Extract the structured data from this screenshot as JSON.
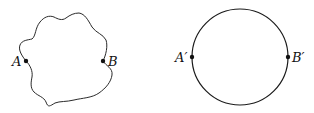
{
  "figure": {
    "left_shape": {
      "type": "irregular-closed-curve",
      "points": {
        "A": {
          "label": "A",
          "x": 26,
          "y": 61
        },
        "B": {
          "label": "B",
          "x": 103,
          "y": 61
        }
      }
    },
    "right_shape": {
      "type": "circle",
      "center": {
        "x": 240,
        "y": 57
      },
      "radius": 48,
      "points": {
        "A_prime": {
          "label": "A′",
          "x": 192,
          "y": 57
        },
        "B_prime": {
          "label": "B′",
          "x": 288,
          "y": 57
        }
      }
    },
    "colors": {
      "stroke": "#1a1a1a",
      "background": "#ffffff"
    }
  }
}
